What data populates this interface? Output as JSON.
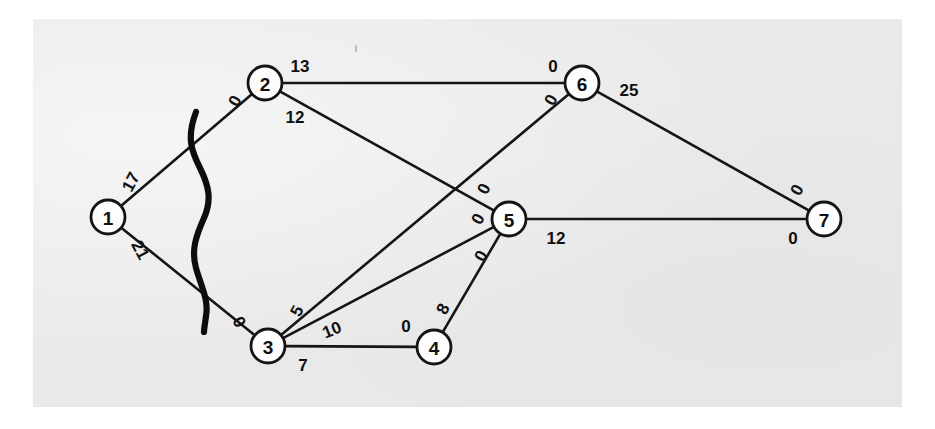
{
  "figure": {
    "kind": "network-flow-graph",
    "background_color": "#ffffff",
    "plate_color": "#ececec",
    "ink_color": "#141414"
  },
  "graph_data": {
    "type": "graph",
    "node_radius": 17,
    "nodes": [
      {
        "id": "1",
        "label": "1",
        "x": 108,
        "y": 217
      },
      {
        "id": "2",
        "label": "2",
        "x": 265,
        "y": 83
      },
      {
        "id": "3",
        "label": "3",
        "x": 268,
        "y": 346
      },
      {
        "id": "4",
        "label": "4",
        "x": 434,
        "y": 347
      },
      {
        "id": "5",
        "label": "5",
        "x": 509,
        "y": 219
      },
      {
        "id": "6",
        "label": "6",
        "x": 582,
        "y": 83
      },
      {
        "id": "7",
        "label": "7",
        "x": 824,
        "y": 219
      }
    ],
    "edges": [
      {
        "id": "edge-1-2",
        "source": "1",
        "target": "2",
        "source_label": "17",
        "target_label": "0",
        "source_label_x": 131,
        "source_label_y": 182,
        "source_label_rotation": -62,
        "target_label_x": 235,
        "target_label_y": 101,
        "target_label_rotation": -62
      },
      {
        "id": "edge-1-3",
        "source": "1",
        "target": "3",
        "source_label": "21",
        "target_label": "0",
        "source_label_x": 140,
        "source_label_y": 250,
        "source_label_rotation": 62,
        "target_label_x": 239,
        "target_label_y": 322,
        "target_label_rotation": 62
      },
      {
        "id": "edge-2-6",
        "source": "2",
        "target": "6",
        "source_label": "13",
        "target_label": "0",
        "source_label_x": 300,
        "source_label_y": 66,
        "source_label_rotation": 0,
        "target_label_x": 553,
        "target_label_y": 66,
        "target_label_rotation": 0
      },
      {
        "id": "edge-2-5",
        "source": "2",
        "target": "5",
        "source_label": "12",
        "target_label": "0",
        "source_label_x": 295,
        "source_label_y": 117,
        "source_label_rotation": 0,
        "target_label_x": 484,
        "target_label_y": 189,
        "target_label_rotation": -65
      },
      {
        "id": "edge-3-6",
        "source": "3",
        "target": "6",
        "source_label": "5",
        "target_label": "0",
        "source_label_x": 297,
        "source_label_y": 311,
        "source_label_rotation": -62,
        "target_label_x": 551,
        "target_label_y": 100,
        "target_label_rotation": -62
      },
      {
        "id": "edge-3-5",
        "source": "3",
        "target": "5",
        "source_label": "10",
        "target_label": "0",
        "source_label_x": 332,
        "source_label_y": 330,
        "source_label_rotation": -22,
        "target_label_x": 478,
        "target_label_y": 219,
        "target_label_rotation": -62
      },
      {
        "id": "edge-3-4",
        "source": "3",
        "target": "4",
        "source_label": "7",
        "target_label": "0",
        "source_label_x": 303,
        "source_label_y": 365,
        "source_label_rotation": 0,
        "target_label_x": 406,
        "target_label_y": 326,
        "target_label_rotation": 0
      },
      {
        "id": "edge-4-5",
        "source": "4",
        "target": "5",
        "source_label": "8",
        "target_label": "0",
        "source_label_x": 443,
        "source_label_y": 309,
        "source_label_rotation": -62,
        "target_label_x": 481,
        "target_label_y": 256,
        "target_label_rotation": -62
      },
      {
        "id": "edge-5-7",
        "source": "5",
        "target": "7",
        "source_label": "12",
        "target_label": "0",
        "source_label_x": 556,
        "source_label_y": 238,
        "source_label_rotation": 0,
        "target_label_x": 793,
        "target_label_y": 238,
        "target_label_rotation": 0
      },
      {
        "id": "edge-6-7",
        "source": "6",
        "target": "7",
        "source_label": "25",
        "target_label": "0",
        "source_label_x": 629,
        "source_label_y": 90,
        "source_label_rotation": 0,
        "target_label_x": 797,
        "target_label_y": 190,
        "target_label_rotation": -62
      }
    ],
    "cut_curve": {
      "id": "cut-curve",
      "path": "M 196 112 C 186 138 192 152 200 168 C 209 186 212 200 204 218 C 196 236 191 250 196 268 C 201 286 209 300 206 316 C 205 324 204 329 204 332"
    },
    "annotations": [
      {
        "id": "speck-top",
        "x": 355,
        "y": 45,
        "width": 2,
        "height": 7
      }
    ]
  }
}
